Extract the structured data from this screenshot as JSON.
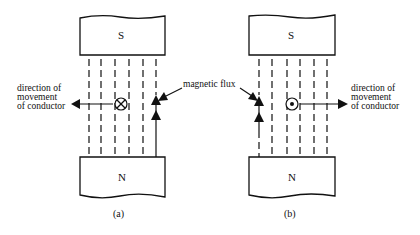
{
  "figure": {
    "panels": [
      {
        "id": "a",
        "caption": "(a)",
        "top_pole": "S",
        "bottom_pole": "N",
        "conductor_symbol": "cross (into page)",
        "movement_direction": "left",
        "movement_label": [
          "direction of",
          "movement",
          "of conductor"
        ]
      },
      {
        "id": "b",
        "caption": "(b)",
        "top_pole": "S",
        "bottom_pole": "N",
        "conductor_symbol": "dot (out of page)",
        "movement_direction": "right",
        "movement_label": [
          "direction of",
          "movement",
          "of conductor"
        ]
      }
    ],
    "shared_label": "magnetic flux"
  }
}
